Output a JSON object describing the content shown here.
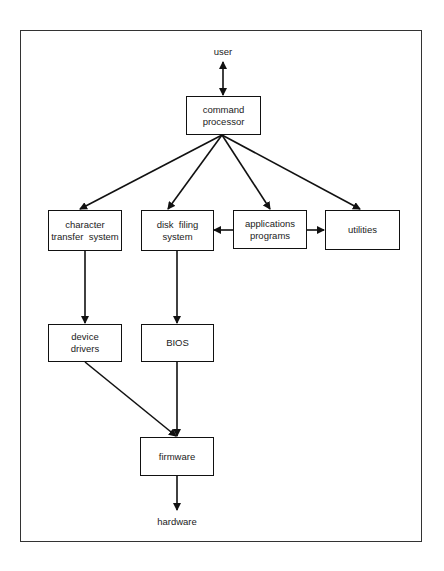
{
  "diagram": {
    "type": "flowchart",
    "nodes": {
      "user": {
        "label": "user"
      },
      "command_processor": {
        "line1": "command",
        "line2": "processor"
      },
      "character_transfer": {
        "line1": "character",
        "line2": "transfer  system"
      },
      "disk_filing": {
        "line1": "disk  filing",
        "line2": "system"
      },
      "applications": {
        "line1": "applications",
        "line2": "programs"
      },
      "utilities": {
        "label": "utilities"
      },
      "device_drivers": {
        "line1": "device",
        "line2": "drivers"
      },
      "bios": {
        "label": "BIOS"
      },
      "firmware": {
        "label": "firmware"
      },
      "hardware": {
        "label": "hardware"
      }
    },
    "edges": [
      {
        "from": "user",
        "to": "command_processor",
        "bidirectional": true
      },
      {
        "from": "command_processor",
        "to": "character_transfer"
      },
      {
        "from": "command_processor",
        "to": "disk_filing"
      },
      {
        "from": "command_processor",
        "to": "applications"
      },
      {
        "from": "command_processor",
        "to": "utilities"
      },
      {
        "from": "applications",
        "to": "disk_filing"
      },
      {
        "from": "applications",
        "to": "utilities"
      },
      {
        "from": "character_transfer",
        "to": "device_drivers"
      },
      {
        "from": "disk_filing",
        "to": "bios"
      },
      {
        "from": "device_drivers",
        "to": "firmware"
      },
      {
        "from": "bios",
        "to": "firmware"
      },
      {
        "from": "firmware",
        "to": "hardware"
      }
    ],
    "colors": {
      "stroke": "#111111",
      "text": "#222222",
      "background": "#ffffff"
    }
  }
}
